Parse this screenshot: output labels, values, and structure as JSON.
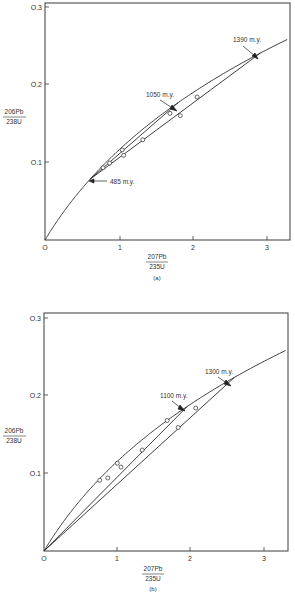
{
  "chart_data": [
    {
      "type": "line",
      "panel": "(a)",
      "title": "",
      "xlabel": "207Pb/235U",
      "ylabel": "206Pb/238U",
      "xlim": [
        0,
        3.3
      ],
      "ylim": [
        0,
        0.3
      ],
      "x_ticks": [
        "0",
        "1",
        "2",
        "3"
      ],
      "y_ticks": [
        "0.1",
        "0.2",
        "0.3"
      ],
      "grid": false,
      "series": [
        {
          "name": "Concordia",
          "kind": "curve",
          "age_range_my": [
            0,
            1550
          ]
        },
        {
          "name": "Discordia 1390-485",
          "kind": "chord",
          "from_age_my": 1390,
          "to_age_my": 485
        },
        {
          "name": "Discordia 1050-485",
          "kind": "chord",
          "from_age_my": 1050,
          "to_age_my": 485
        },
        {
          "name": "Samples",
          "kind": "points",
          "x": [
            2.07,
            1.7,
            1.84,
            1.33,
            1.05,
            1.07,
            0.88,
            0.79
          ],
          "y": [
            0.184,
            0.163,
            0.16,
            0.129,
            0.116,
            0.109,
            0.099,
            0.093
          ]
        }
      ],
      "annotations": [
        "1390 m.y.",
        "1050 m.y.",
        "485 m.y."
      ]
    },
    {
      "type": "line",
      "panel": "(b)",
      "title": "",
      "xlabel": "207Pb/235U",
      "ylabel": "206Pb/238U",
      "xlim": [
        0,
        3.3
      ],
      "ylim": [
        0,
        0.3
      ],
      "x_ticks": [
        "0",
        "1",
        "2",
        "3"
      ],
      "y_ticks": [
        "0.1",
        "0.2",
        "0.3"
      ],
      "grid": false,
      "series": [
        {
          "name": "Concordia",
          "kind": "curve",
          "age_range_my": [
            0,
            1550
          ]
        },
        {
          "name": "Discordia 1300-0",
          "kind": "chord",
          "from_age_my": 1300,
          "to_age_my": 0
        },
        {
          "name": "Discordia 1100-0",
          "kind": "chord",
          "from_age_my": 1100,
          "to_age_my": 0
        },
        {
          "name": "Samples",
          "kind": "points",
          "x": [
            2.07,
            1.83,
            1.68,
            1.34,
            1.0,
            1.05,
            0.76,
            0.87
          ],
          "y": [
            0.184,
            0.159,
            0.168,
            0.13,
            0.113,
            0.108,
            0.091,
            0.094
          ]
        }
      ],
      "annotations": [
        "1300 m.y.",
        "1100 m.y."
      ]
    }
  ],
  "panels": [
    {
      "caption": "(a)",
      "origin_label": "O",
      "x_tick_labels": [
        "1",
        "2",
        "3"
      ],
      "y_tick_labels": [
        "O.1",
        "O.2",
        "O.3"
      ],
      "xlabel_num": "207Pb",
      "xlabel_den": "235U",
      "ylabel_num": "206Pb",
      "ylabel_den": "238U",
      "annotations": {
        "upper": "1390 m.y.",
        "middle": "1050 m.y.",
        "lower": "485 m.y."
      }
    },
    {
      "caption": "(b)",
      "origin_label": "O",
      "x_tick_labels": [
        "1",
        "2",
        "3"
      ],
      "y_tick_labels": [
        "O.1",
        "O.2",
        "O.3"
      ],
      "xlabel_num": "207Pb",
      "xlabel_den": "235U",
      "ylabel_num": "206Pb",
      "ylabel_den": "238U",
      "annotations": {
        "upper": "1300 m.y.",
        "middle": "1100 m.y."
      }
    }
  ],
  "colors": {
    "ink": "#2a2a2a",
    "background": "#ffffff"
  }
}
